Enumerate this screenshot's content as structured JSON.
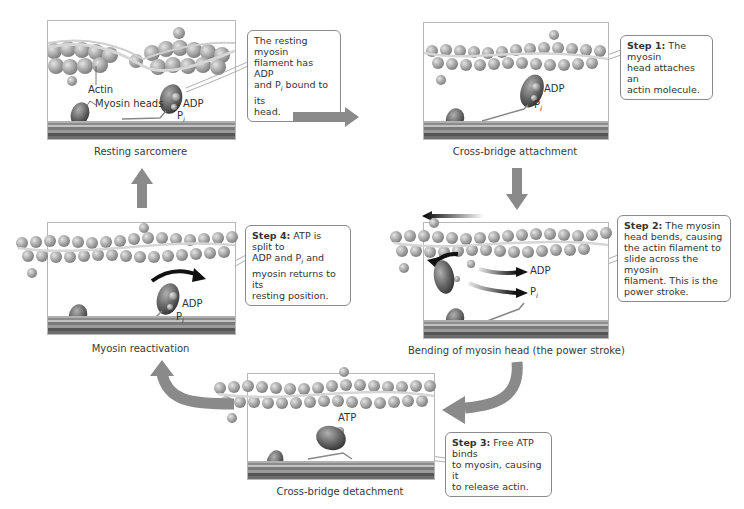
{
  "diagram": {
    "type": "cross-bridge cycle",
    "colors": {
      "arrow_gray": "#8a8a8a",
      "actin": "#a6a6a6",
      "myosin": "#6b6b6b",
      "panel_border": "#b8b8b8"
    }
  },
  "panels": {
    "resting": {
      "caption": "Resting sarcomere",
      "labels": {
        "actin": "Actin",
        "myosin_heads": "Myosin heads",
        "adp": "ADP",
        "p": "P",
        "p_sub": "i"
      },
      "callout": {
        "step": "",
        "text": "The resting myosin filament has ADP and Pi bound to its head.",
        "lines": [
          "The resting myosin",
          "filament has ADP",
          "and P",
          "bound to its",
          "head."
        ]
      }
    },
    "attachment": {
      "caption": "Cross-bridge attachment",
      "labels": {
        "adp": "ADP",
        "p": "P",
        "p_sub": "i"
      },
      "callout": {
        "step": "Step 1:",
        "lines": [
          " The myosin",
          "head attaches an",
          "actin molecule."
        ]
      }
    },
    "power_stroke": {
      "caption": "Bending of myosin head (the power stroke)",
      "labels": {
        "adp": "ADP",
        "p": "P",
        "p_sub": "i"
      },
      "callout": {
        "step": "Step 2:",
        "lines": [
          " The myosin",
          "head bends, causing",
          "the actin filament to",
          "slide across the myosin",
          "filament. This is the",
          "power stroke."
        ]
      }
    },
    "detachment": {
      "caption": "Cross-bridge detachment",
      "labels": {
        "atp": "ATP"
      },
      "callout": {
        "step": "Step 3:",
        "lines": [
          " Free ATP binds",
          "to myosin, causing it",
          "to release actin."
        ]
      }
    },
    "reactivation": {
      "caption": "Myosin reactivation",
      "labels": {
        "adp": "ADP",
        "p": "P",
        "p_sub": "i"
      },
      "callout": {
        "step": "Step 4:",
        "lines": [
          " ATP is split to",
          "ADP and P",
          " and",
          "myosin returns to its",
          "resting position."
        ],
        "sub": "i"
      }
    }
  },
  "flow_arrows": [
    {
      "from": "resting",
      "to": "attachment",
      "direction": "right"
    },
    {
      "from": "attachment",
      "to": "power_stroke",
      "direction": "down"
    },
    {
      "from": "power_stroke",
      "to": "detachment",
      "direction": "curved-down-left"
    },
    {
      "from": "detachment",
      "to": "reactivation",
      "direction": "curved-left-up"
    },
    {
      "from": "reactivation",
      "to": "resting",
      "direction": "up"
    }
  ]
}
